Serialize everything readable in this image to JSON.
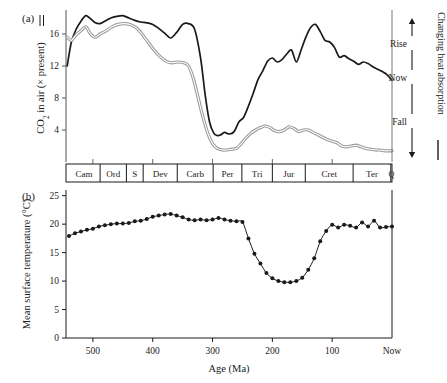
{
  "figure": {
    "panel_a_tag": "(a)",
    "panel_b_tag": "(b)",
    "x_axis_label": "Age (Ma)"
  },
  "panel_a": {
    "y_label_main": "CO",
    "y_label_sub": "2",
    "y_label_rest": " in air (× present)",
    "legend_marker": "double-line",
    "y_ticks": [
      "4",
      "8",
      "12",
      "16"
    ],
    "y_tick_values": [
      4,
      8,
      12,
      16
    ],
    "ylim": [
      0,
      19
    ],
    "side_axis": {
      "top_label": "Rise",
      "mid_label": "Now",
      "bottom_label": "Fall",
      "rotated_label": "Changing heat absorption",
      "legend_marker": "solid-line"
    }
  },
  "panel_b": {
    "y_label": "Mean surface temperature (°C)",
    "y_ticks": [
      "0",
      "5",
      "10",
      "15",
      "20",
      "25"
    ],
    "y_tick_values": [
      0,
      5,
      10,
      15,
      20,
      25
    ],
    "ylim": [
      0,
      26
    ]
  },
  "periods": [
    {
      "label": "Cam",
      "start": 542,
      "end": 488
    },
    {
      "label": "Ord",
      "start": 488,
      "end": 444
    },
    {
      "label": "S",
      "start": 444,
      "end": 416
    },
    {
      "label": "Dev",
      "start": 416,
      "end": 359
    },
    {
      "label": "Carb",
      "start": 359,
      "end": 299
    },
    {
      "label": "Per",
      "start": 299,
      "end": 251
    },
    {
      "label": "Tri",
      "start": 251,
      "end": 200
    },
    {
      "label": "Jur",
      "start": 200,
      "end": 145
    },
    {
      "label": "Cret",
      "start": 145,
      "end": 65
    },
    {
      "label": "Ter",
      "start": 65,
      "end": 2
    },
    {
      "label": "Q",
      "start": 2,
      "end": 0
    }
  ],
  "x_axis": {
    "ticks": [
      {
        "label": "500",
        "value": 500
      },
      {
        "label": "400",
        "value": 400
      },
      {
        "label": "300",
        "value": 300
      },
      {
        "label": "200",
        "value": 200
      },
      {
        "label": "100",
        "value": 100
      },
      {
        "label": "Now",
        "value": 0
      }
    ],
    "xlim": [
      545,
      0
    ]
  },
  "chart_data": [
    {
      "type": "line",
      "id": "co2-in-air",
      "title": "CO2 in air (x present)",
      "xlabel": "Age (Ma)",
      "ylabel": "CO2 in air (× present)",
      "xlim": [
        545,
        0
      ],
      "ylim": [
        0,
        19
      ],
      "grid": false,
      "legend": "inline-axis-markers",
      "series": [
        {
          "name": "GEOCARB (black)",
          "color": "#1a1a1a",
          "x": [
            543,
            536,
            528,
            520,
            512,
            504,
            496,
            488,
            480,
            470,
            460,
            450,
            440,
            430,
            420,
            410,
            400,
            390,
            380,
            370,
            360,
            350,
            340,
            330,
            320,
            312,
            305,
            298,
            292,
            286,
            280,
            272,
            264,
            256,
            248,
            240,
            232,
            224,
            216,
            208,
            200,
            192,
            184,
            176,
            168,
            160,
            152,
            144,
            136,
            128,
            120,
            112,
            104,
            96,
            88,
            80,
            72,
            64,
            56,
            48,
            40,
            32,
            24,
            16,
            8,
            0
          ],
          "y": [
            12.0,
            15.0,
            16.6,
            17.6,
            18.3,
            17.9,
            17.4,
            17.3,
            17.6,
            18.0,
            18.2,
            18.3,
            18.0,
            17.7,
            17.5,
            17.4,
            17.2,
            16.7,
            16.1,
            15.5,
            16.2,
            17.2,
            17.3,
            16.6,
            13.0,
            8.2,
            5.0,
            3.6,
            3.3,
            3.4,
            3.7,
            3.5,
            3.8,
            5.0,
            5.6,
            7.0,
            8.6,
            10.3,
            11.4,
            12.6,
            13.0,
            12.5,
            12.8,
            13.5,
            14.0,
            12.5,
            14.0,
            15.6,
            16.8,
            17.2,
            16.3,
            15.2,
            15.0,
            14.3,
            13.1,
            13.3,
            12.9,
            12.6,
            12.2,
            12.5,
            12.3,
            11.9,
            11.6,
            11.3,
            10.9,
            10.2
          ]
        },
        {
          "name": "Alternate model (grey)",
          "color": "#9a9a9a",
          "x": [
            543,
            536,
            528,
            520,
            512,
            504,
            496,
            488,
            478,
            468,
            458,
            448,
            438,
            428,
            418,
            408,
            398,
            388,
            378,
            368,
            358,
            348,
            340,
            332,
            324,
            316,
            308,
            300,
            292,
            284,
            276,
            268,
            260,
            252,
            244,
            236,
            228,
            220,
            212,
            204,
            196,
            188,
            180,
            172,
            164,
            156,
            148,
            140,
            132,
            124,
            116,
            108,
            100,
            92,
            84,
            76,
            68,
            60,
            52,
            44,
            36,
            28,
            20,
            12,
            4,
            0
          ],
          "y": [
            15.6,
            15.2,
            15.9,
            16.4,
            16.9,
            16.0,
            15.6,
            16.0,
            16.4,
            16.9,
            17.2,
            17.3,
            17.2,
            16.8,
            16.0,
            15.0,
            14.0,
            13.2,
            12.6,
            12.4,
            12.5,
            12.4,
            12.0,
            10.4,
            8.0,
            5.6,
            3.6,
            2.3,
            1.7,
            1.5,
            1.5,
            1.6,
            1.7,
            2.3,
            3.0,
            3.6,
            4.0,
            4.3,
            4.5,
            4.3,
            3.9,
            3.8,
            4.0,
            4.4,
            4.2,
            3.8,
            4.0,
            4.0,
            3.7,
            3.4,
            3.1,
            2.8,
            2.6,
            2.4,
            2.0,
            1.9,
            2.0,
            2.1,
            1.9,
            1.7,
            1.6,
            1.5,
            1.5,
            1.4,
            1.4,
            1.4
          ]
        }
      ]
    },
    {
      "type": "line",
      "id": "mean-surface-temperature",
      "title": "Mean surface temperature (°C)",
      "xlabel": "Age (Ma)",
      "ylabel": "Mean surface temperature (°C)",
      "xlim": [
        545,
        0
      ],
      "ylim": [
        0,
        26
      ],
      "grid": false,
      "markers": "filled-circle",
      "series": [
        {
          "name": "Mean surface temperature",
          "color": "#1a1a1a",
          "x": [
            540,
            530,
            520,
            510,
            500,
            490,
            480,
            470,
            460,
            450,
            440,
            430,
            420,
            410,
            400,
            390,
            380,
            370,
            360,
            350,
            340,
            330,
            320,
            310,
            300,
            290,
            280,
            270,
            260,
            250,
            240,
            230,
            220,
            210,
            200,
            190,
            180,
            170,
            160,
            150,
            140,
            130,
            120,
            110,
            100,
            90,
            80,
            70,
            60,
            50,
            40,
            30,
            20,
            10,
            0
          ],
          "y": [
            17.9,
            18.4,
            18.7,
            19.0,
            19.2,
            19.6,
            19.8,
            20.0,
            20.1,
            20.1,
            20.2,
            20.5,
            20.6,
            20.9,
            21.3,
            21.5,
            21.7,
            21.8,
            21.5,
            21.2,
            20.8,
            20.7,
            20.8,
            20.7,
            20.8,
            21.1,
            20.8,
            20.6,
            20.5,
            20.4,
            17.5,
            14.8,
            13.1,
            11.4,
            10.5,
            10.0,
            9.8,
            9.8,
            10.0,
            10.6,
            12.0,
            14.0,
            17.0,
            18.8,
            19.9,
            19.4,
            19.9,
            19.7,
            19.4,
            20.3,
            19.6,
            20.6,
            19.4,
            19.5,
            19.6
          ]
        }
      ]
    }
  ]
}
